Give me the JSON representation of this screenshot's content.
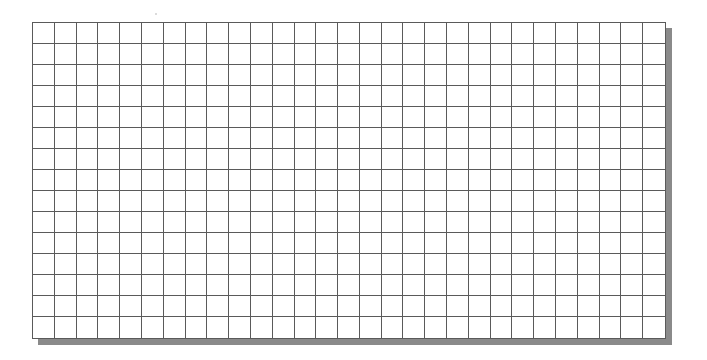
{
  "grid": {
    "columns": 29,
    "rows": 15,
    "line_color": "#5a5a5a",
    "background_color": "#ffffff",
    "shadow_color": "#8a8a8a"
  }
}
